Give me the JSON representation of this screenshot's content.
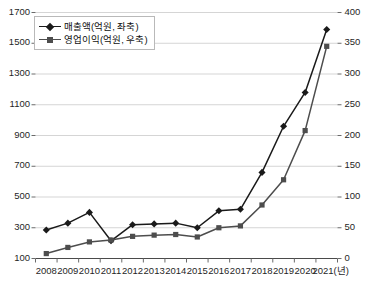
{
  "chart_data": {
    "type": "line",
    "title": "",
    "xlabel": "2021(년)",
    "ylabel": "",
    "grid": true,
    "legend_position": "top-left",
    "categories": [
      "2008",
      "2009",
      "2010",
      "2011",
      "2012",
      "2013",
      "2014",
      "2015",
      "2016",
      "2017",
      "2018",
      "2019",
      "2020",
      "2021"
    ],
    "x_axis": {
      "unit_label": "(년)",
      "tick_labels": [
        "2008",
        "2009",
        "2010",
        "2011",
        "2012",
        "2013",
        "2014",
        "2015",
        "2016",
        "2017",
        "2018",
        "2019",
        "2020",
        "2021(년)"
      ]
    },
    "y_axis_left": {
      "label": "매출액(억원, 좌축)",
      "min": 100,
      "max": 1700,
      "step": 200,
      "tick_labels": [
        "100",
        "300",
        "500",
        "700",
        "900",
        "1100",
        "1300",
        "1500",
        "1700"
      ]
    },
    "y_axis_right": {
      "label": "영업이익(억원, 우축)",
      "min": 0,
      "max": 400,
      "step": 50,
      "tick_labels": [
        "0",
        "50",
        "100",
        "150",
        "200",
        "250",
        "300",
        "350",
        "400"
      ]
    },
    "series": [
      {
        "name": "매출액(억원, 좌축)",
        "axis": "left",
        "color": "#1a1a1a",
        "marker": "diamond",
        "values": [
          285,
          330,
          400,
          215,
          320,
          325,
          330,
          300,
          410,
          420,
          660,
          960,
          1180,
          1590
        ]
      },
      {
        "name": "영업이익(억원, 우축)",
        "axis": "right",
        "color": "#4d4d4d",
        "marker": "square",
        "values": [
          8,
          18,
          27,
          30,
          36,
          38,
          39,
          35,
          50,
          53,
          87,
          128,
          208,
          345
        ]
      }
    ]
  },
  "legend": {
    "items": [
      {
        "label": "매출액(억원, 좌축)",
        "color": "#1a1a1a"
      },
      {
        "label": "영업이익(억원, 우축)",
        "color": "#4d4d4d"
      }
    ]
  },
  "caption": ""
}
